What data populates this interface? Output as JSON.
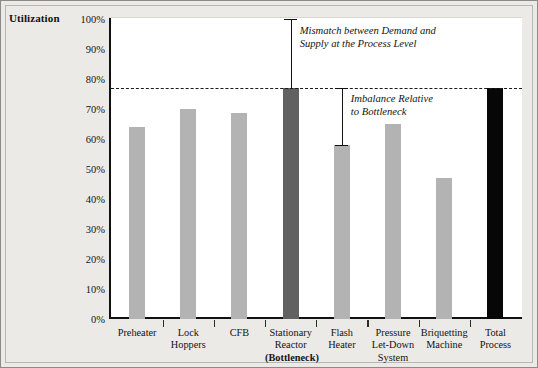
{
  "chart_data": {
    "type": "bar",
    "title": "",
    "xlabel": "",
    "ylabel": "Utilization",
    "ylim": [
      0,
      100
    ],
    "grid": false,
    "legend": "none",
    "categories": [
      "Preheater",
      "Lock Hoppers",
      "CFB",
      "Stationary Reactor (Bottleneck)",
      "Flash Heater",
      "Pressure Let-Down System",
      "Briquetting Machine",
      "Total Process"
    ],
    "values": [
      64,
      70,
      68.5,
      77,
      58,
      65,
      47,
      77
    ],
    "ytick_labels": [
      "100%",
      "90%",
      "80%",
      "70%",
      "60%",
      "50%",
      "40%",
      "30%",
      "20%",
      "10%",
      "0%"
    ],
    "ytick_values": [
      100,
      90,
      80,
      70,
      60,
      50,
      40,
      30,
      20,
      10,
      0
    ],
    "bottleneck_level": 77,
    "bar_colors": [
      "#b3b3b3",
      "#b3b3b3",
      "#b3b3b3",
      "#616161",
      "#b3b3b3",
      "#b3b3b3",
      "#b3b3b3",
      "#070707"
    ],
    "annotations": [
      {
        "id": "mismatch",
        "line1": "Mismatch between Demand and",
        "line2": "Supply at the Process Level",
        "from": 100,
        "to": 77
      },
      {
        "id": "imbalance",
        "line1": "Imbalance Relative",
        "line2": "to Bottleneck",
        "from": 77,
        "to": 58
      }
    ]
  },
  "axis": {
    "title": "Utilization"
  },
  "xaxis_labels": [
    {
      "lines": [
        "Preheater"
      ],
      "bold": [
        false
      ]
    },
    {
      "lines": [
        "Lock",
        "Hoppers"
      ],
      "bold": [
        false,
        false
      ]
    },
    {
      "lines": [
        "CFB"
      ],
      "bold": [
        false
      ]
    },
    {
      "lines": [
        "Stationary",
        "Reactor",
        "(Bottleneck)"
      ],
      "bold": [
        false,
        false,
        true
      ]
    },
    {
      "lines": [
        "Flash",
        "Heater"
      ],
      "bold": [
        false,
        false
      ]
    },
    {
      "lines": [
        "Pressure",
        "Let-Down",
        "System"
      ],
      "bold": [
        false,
        false,
        false
      ]
    },
    {
      "lines": [
        "Briquetting",
        "Machine"
      ],
      "bold": [
        false,
        false
      ]
    },
    {
      "lines": [
        "Total",
        "Process"
      ],
      "bold": [
        false,
        false
      ]
    }
  ],
  "colors": {
    "bar_light": "#b3b3b3",
    "bar_dark": "#616161",
    "bar_black": "#070707",
    "axis": "#111111",
    "page_bg": "#eceae7",
    "plot_bg": "#ffffff"
  }
}
